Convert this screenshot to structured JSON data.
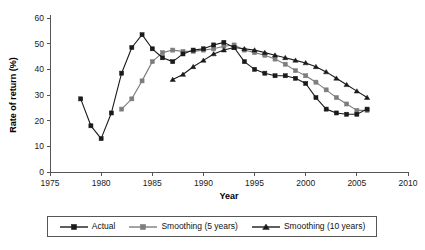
{
  "chart_data": {
    "type": "line",
    "title": "",
    "subtitle": "",
    "xlabel": "Year",
    "ylabel": "Rate of return (%)",
    "xlim": [
      1975,
      2010
    ],
    "ylim": [
      0,
      60
    ],
    "xticks": [
      1975,
      1980,
      1985,
      1990,
      1995,
      2000,
      2005,
      2010
    ],
    "yticks": [
      0,
      10,
      20,
      30,
      40,
      50,
      60
    ],
    "grid": false,
    "legend_position": "bottom",
    "annotations": [],
    "series": [
      {
        "name": "Actual",
        "color": "#1a1a1a",
        "marker": "square",
        "x": [
          1978,
          1979,
          1980,
          1981,
          1982,
          1983,
          1984,
          1985,
          1986,
          1987,
          1988,
          1989,
          1990,
          1991,
          1992,
          1993,
          1994,
          1995,
          1996,
          1997,
          1998,
          1999,
          2000,
          2001,
          2002,
          2003,
          2004,
          2005,
          2006
        ],
        "values": [
          28.5,
          18.0,
          13.0,
          23.0,
          38.5,
          48.5,
          53.5,
          48.0,
          44.5,
          43.0,
          46.0,
          47.5,
          48.0,
          49.5,
          50.5,
          48.5,
          43.0,
          40.0,
          38.5,
          37.5,
          37.5,
          36.5,
          34.5,
          29.0,
          24.5,
          23.0,
          22.5,
          22.5,
          24.5
        ]
      },
      {
        "name": "Smoothing (5 years)",
        "color": "#7d7d7d",
        "marker": "square",
        "x": [
          1982,
          1983,
          1984,
          1985,
          1986,
          1987,
          1988,
          1989,
          1990,
          1991,
          1992,
          1993,
          1994,
          1995,
          1996,
          1997,
          1998,
          1999,
          2000,
          2001,
          2002,
          2003,
          2004,
          2005,
          2006
        ],
        "values": [
          24.5,
          28.5,
          35.5,
          43.0,
          46.5,
          47.5,
          47.0,
          47.0,
          47.5,
          48.0,
          49.0,
          49.5,
          47.5,
          46.5,
          45.5,
          44.0,
          42.0,
          39.5,
          37.5,
          35.0,
          32.0,
          29.0,
          26.5,
          24.0,
          24.0
        ]
      },
      {
        "name": "Smoothing (10 years)",
        "color": "#1a1a1a",
        "marker": "triangle",
        "x": [
          1987,
          1988,
          1989,
          1990,
          1991,
          1992,
          1993,
          1994,
          1995,
          1996,
          1997,
          1998,
          1999,
          2000,
          2001,
          2002,
          2003,
          2004,
          2005,
          2006
        ],
        "values": [
          36.0,
          38.0,
          41.0,
          43.5,
          46.0,
          47.5,
          48.5,
          48.0,
          47.5,
          46.5,
          45.5,
          44.5,
          43.5,
          42.5,
          41.0,
          39.0,
          36.5,
          34.0,
          31.5,
          29.0
        ]
      }
    ]
  },
  "legend": {
    "items": [
      {
        "label": "Actual",
        "color": "#1a1a1a",
        "marker": "square"
      },
      {
        "label": "Smoothing (5 years)",
        "color": "#7d7d7d",
        "marker": "square"
      },
      {
        "label": "Smoothing (10 years)",
        "color": "#1a1a1a",
        "marker": "triangle"
      }
    ]
  }
}
